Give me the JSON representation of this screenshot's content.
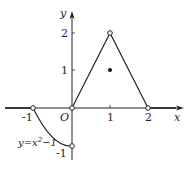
{
  "figure": {
    "axes": {
      "x_label": "x",
      "y_label": "y",
      "origin_label": "O",
      "x_ticks": [
        "-1",
        "1",
        "2"
      ],
      "y_ticks": [
        "2",
        "1",
        "-1"
      ]
    },
    "curve_label": "y=x²−1",
    "curve_label_base": "y=x",
    "curve_label_sup": "2",
    "curve_label_tail": "−1",
    "pieces": [
      {
        "desc": "y=0 for x<-1",
        "from": [
          -1.0,
          0
        ],
        "to_left": true
      },
      {
        "desc": "y=x^2-1 on (-1,0)",
        "endpoints_open": [
          [
            -1,
            0
          ],
          [
            0,
            -1
          ]
        ]
      },
      {
        "desc": "line from (0,0) to (1,2)",
        "endpoints_open": [
          [
            0,
            0
          ],
          [
            1,
            2
          ]
        ]
      },
      {
        "desc": "line from (1,2) to (2,0)",
        "endpoints_open": [
          [
            2,
            0
          ]
        ]
      },
      {
        "desc": "y=0 for x>2"
      }
    ],
    "filled_points": [
      [
        1,
        1
      ]
    ],
    "open_points": [
      [
        -1,
        0
      ],
      [
        0,
        0
      ],
      [
        0,
        -1
      ],
      [
        1,
        2
      ],
      [
        2,
        0
      ]
    ]
  }
}
